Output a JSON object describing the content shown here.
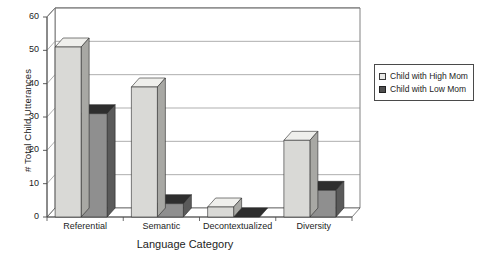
{
  "chart_data": {
    "type": "bar",
    "title": "",
    "subtitle": "",
    "xlabel": "Language Category",
    "ylabel": "# Total Child Utterances",
    "categories": [
      "Referential",
      "Semantic",
      "Decontextualized",
      "Diversity"
    ],
    "series": [
      {
        "name": "Child with High Mom",
        "color": "#d9d9d6",
        "values": [
          51,
          39,
          3,
          23
        ]
      },
      {
        "name": "Child with Low Mom",
        "color": "#8f8f8f",
        "values": [
          31,
          4,
          0,
          8
        ]
      }
    ],
    "ylim": [
      0,
      60
    ],
    "yticks": [
      0,
      10,
      20,
      30,
      40,
      50,
      60
    ],
    "ytick_labels": [
      "0",
      "10",
      "20",
      "30",
      "40",
      "50",
      "60"
    ],
    "grid": true,
    "grid_axis": "y",
    "legend_position": "right",
    "style": "3d-bar",
    "annotations": []
  },
  "legend": {
    "items": [
      {
        "label": "Child with High Mom",
        "swatch": "light-square-icon"
      },
      {
        "label": "Child with Low Mom",
        "swatch": "dark-square-icon"
      }
    ]
  },
  "colors": {
    "series_high_front": "#d9d9d6",
    "series_high_side": "#a8a8a4",
    "series_high_top": "#efefec",
    "series_low_front": "#8f8f8f",
    "series_low_side": "#5a5a5a",
    "series_low_top": "#2e2e2e",
    "axis": "#4a4a4a",
    "grid": "#8c8c8c",
    "text": "#1d1d1d",
    "background": "#ffffff"
  }
}
